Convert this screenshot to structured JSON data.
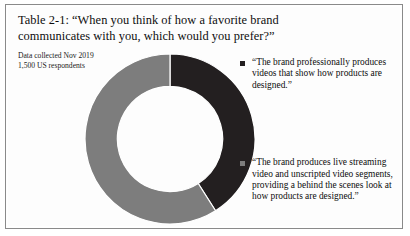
{
  "figure": {
    "title": "Table 2-1: “When you think of how a favorite brand communicates with you, which would you prefer?”",
    "source_line_1": "Data collected Nov 2019",
    "source_line_2": "1,500 US respondents"
  },
  "colors": {
    "dark_segment": "#231f20",
    "gray_segment": "#7d7d7d",
    "border": "#8a8a8a",
    "background": "#ffffff",
    "text": "#0d0d0d"
  },
  "chart_data": {
    "type": "pie",
    "variant": "donut",
    "title": "Table 2-1: “When you think of how a favorite brand communicates with you, which would you prefer?”",
    "subtitle": "Data collected Nov 2019 / 1,500 US respondents",
    "legend_position": "right",
    "grid": false,
    "inner_radius_ratio": 0.62,
    "start_angle_deg": 0,
    "direction": "clockwise",
    "categories": [
      "“The brand professionally produces videos that show how products are designed.”",
      "“The brand produces live streaming video and unscripted video segments, providing a behind the scenes look at how products are designed.”"
    ],
    "values": [
      41,
      59
    ],
    "value_unit": "percent",
    "colors": [
      "#231f20",
      "#7d7d7d"
    ],
    "labels_shown": false
  },
  "legend": {
    "items": [
      {
        "marker": "square-marker-dark",
        "color": "#231f20",
        "label": "“The brand professionally produces videos that show how products are designed.”"
      },
      {
        "marker": "square-marker-gray",
        "color": "#7d7d7d",
        "label": "“The brand produces live streaming video and unscripted video segments, providing a behind the scenes look at how products are designed.”"
      }
    ]
  }
}
